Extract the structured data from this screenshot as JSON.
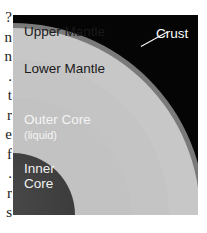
{
  "margin_fragments": [
    "?",
    "n",
    "n",
    ".",
    "t",
    "r",
    "e",
    "f",
    ".",
    "r",
    "s"
  ],
  "figure": {
    "layers": {
      "crust": "Crust",
      "upper_mantle": "Upper Mantle",
      "lower_mantle": "Lower Mantle",
      "outer_core": "Outer Core",
      "outer_core_note": "(liquid)",
      "inner_core_line1": "Inner",
      "inner_core_line2": "Core"
    },
    "colors": {
      "background": "#050505",
      "crust": "#7a7a7a",
      "mantle": "#c7c7c7",
      "outer_core": "#c2c2c2",
      "inner_core": "#3c3c3c"
    }
  }
}
